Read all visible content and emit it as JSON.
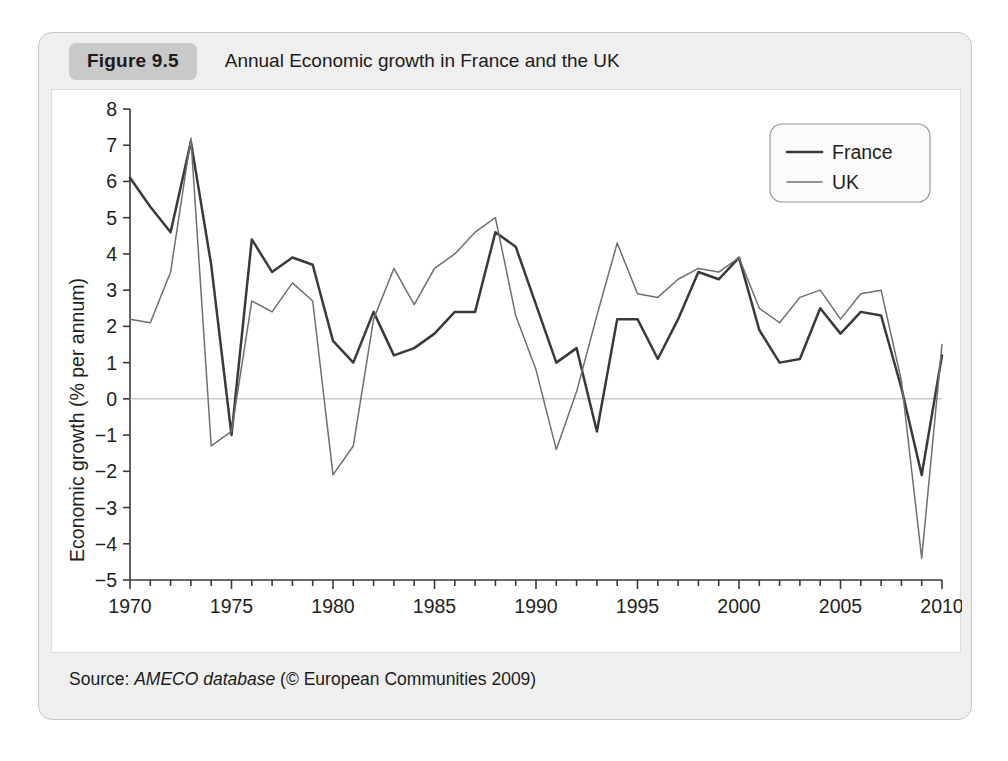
{
  "figure": {
    "tag": "Figure 9.5",
    "title": "Annual Economic growth in France and the UK",
    "source_label": "Source:",
    "source_db": "AMECO database",
    "source_rights": "(© European Communities 2009)"
  },
  "colors": {
    "card_background": "#efefef",
    "panel_background": "#ffffff",
    "tag_background": "#c9c9c9",
    "france_line": "#3a3a3a",
    "uk_line": "#6f6f6f",
    "axis": "#3a3a3a",
    "zero_line": "#b0b0b0",
    "text": "#231f20"
  },
  "legend": {
    "position": "top-right",
    "entries": [
      {
        "label": "France",
        "color": "#3a3a3a",
        "width": 2.6
      },
      {
        "label": "UK",
        "color": "#6f6f6f",
        "width": 1.6
      }
    ]
  },
  "chart_data": {
    "type": "line",
    "title": "Annual Economic growth in France and the UK",
    "xlabel": "",
    "ylabel": "Economic growth (% per annum)",
    "xlim": [
      1970,
      2010
    ],
    "ylim": [
      -5,
      8
    ],
    "grid": false,
    "zero_line": true,
    "x_tick_labels": [
      "1970",
      "1975",
      "1980",
      "1985",
      "1990",
      "1995",
      "2000",
      "2005",
      "2010"
    ],
    "x_tick_values": [
      1970,
      1975,
      1980,
      1985,
      1990,
      1995,
      2000,
      2005,
      2010
    ],
    "x_minor_tick_step": 1,
    "y_tick_labels": [
      "8",
      "7",
      "6",
      "5",
      "4",
      "3",
      "2",
      "1",
      "0",
      "−1",
      "−2",
      "−3",
      "−4",
      "−5"
    ],
    "y_tick_values": [
      8,
      7,
      6,
      5,
      4,
      3,
      2,
      1,
      0,
      -1,
      -2,
      -3,
      -4,
      -5
    ],
    "x": [
      1970,
      1971,
      1972,
      1973,
      1974,
      1975,
      1976,
      1977,
      1978,
      1979,
      1980,
      1981,
      1982,
      1983,
      1984,
      1985,
      1986,
      1987,
      1988,
      1989,
      1990,
      1991,
      1992,
      1993,
      1994,
      1995,
      1996,
      1997,
      1998,
      1999,
      2000,
      2001,
      2002,
      2003,
      2004,
      2005,
      2006,
      2007,
      2008,
      2009,
      2010
    ],
    "series": [
      {
        "name": "France",
        "color": "#3a3a3a",
        "values": [
          6.1,
          5.3,
          4.6,
          7.1,
          3.7,
          -1.0,
          4.4,
          3.5,
          3.9,
          3.7,
          1.6,
          1.0,
          2.4,
          1.2,
          1.4,
          1.8,
          2.4,
          2.4,
          4.6,
          4.2,
          2.6,
          1.0,
          1.4,
          -0.9,
          2.2,
          2.2,
          1.1,
          2.2,
          3.5,
          3.3,
          3.9,
          1.9,
          1.0,
          1.1,
          2.5,
          1.8,
          2.4,
          2.3,
          0.3,
          -2.1,
          1.2
        ]
      },
      {
        "name": "UK",
        "color": "#6f6f6f",
        "values": [
          2.2,
          2.1,
          3.5,
          7.2,
          -1.3,
          -0.9,
          2.7,
          2.4,
          3.2,
          2.7,
          -2.1,
          -1.3,
          2.2,
          3.6,
          2.6,
          3.6,
          4.0,
          4.6,
          5.0,
          2.3,
          0.8,
          -1.4,
          0.2,
          2.3,
          4.3,
          2.9,
          2.8,
          3.3,
          3.6,
          3.5,
          3.9,
          2.5,
          2.1,
          2.8,
          3.0,
          2.2,
          2.9,
          3.0,
          0.5,
          -4.4,
          1.5
        ]
      }
    ]
  }
}
